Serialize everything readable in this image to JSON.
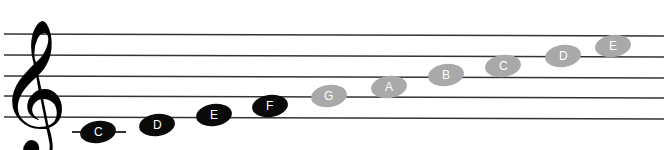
{
  "diagram": {
    "clef": "treble-clef",
    "staff_lines": 5,
    "colors": {
      "dark_note": "#0a0a0a",
      "light_note": "#a9a9a9",
      "line": "#333333"
    },
    "notes": [
      {
        "label": "C",
        "style": "dark"
      },
      {
        "label": "D",
        "style": "dark"
      },
      {
        "label": "E",
        "style": "dark"
      },
      {
        "label": "F",
        "style": "dark"
      },
      {
        "label": "G",
        "style": "light"
      },
      {
        "label": "A",
        "style": "light"
      },
      {
        "label": "B",
        "style": "light"
      },
      {
        "label": "C",
        "style": "light"
      },
      {
        "label": "D",
        "style": "light"
      },
      {
        "label": "E",
        "style": "light"
      }
    ]
  }
}
